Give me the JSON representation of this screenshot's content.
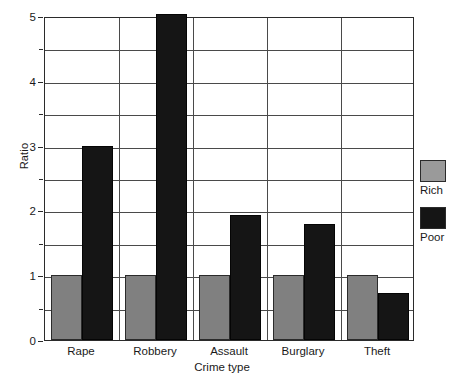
{
  "chart_data": {
    "type": "bar",
    "title": "",
    "xlabel": "Crime type",
    "ylabel": "Ratio",
    "categories": [
      "Rape",
      "Robbery",
      "Assault",
      "Burglary",
      "Theft"
    ],
    "series": [
      {
        "name": "Rich",
        "color": "#808080",
        "values": [
          1.0,
          1.0,
          1.0,
          1.0,
          1.0
        ]
      },
      {
        "name": "Poor",
        "color": "#151515",
        "values": [
          3.0,
          5.0,
          1.93,
          1.79,
          0.72
        ]
      }
    ],
    "ylim": [
      0,
      5
    ],
    "yticks": [
      0,
      1,
      2,
      3,
      4,
      5
    ],
    "ytick_labels": [
      "0",
      "1",
      "2",
      "3",
      "4",
      "5"
    ],
    "yminor_step": 0.5,
    "grid": true,
    "legend_position": "right"
  },
  "axes": {
    "y_title": "Ratio",
    "x_title": "Crime type"
  },
  "legend": {
    "items": [
      {
        "label": "Rich",
        "swatch": "gray-swatch"
      },
      {
        "label": "Poor",
        "swatch": "black-swatch"
      }
    ]
  }
}
